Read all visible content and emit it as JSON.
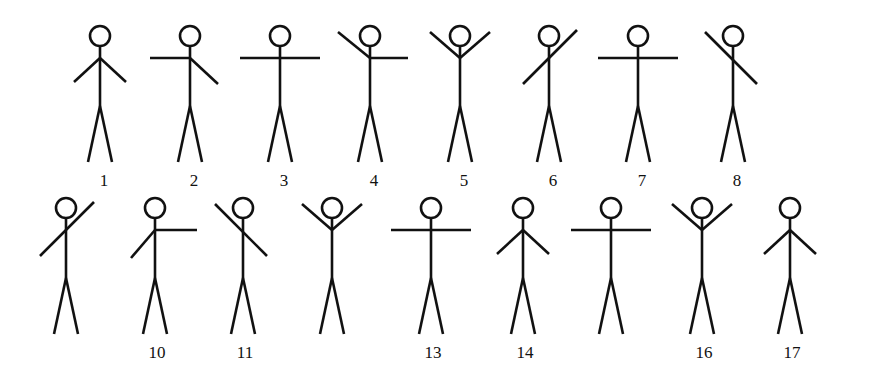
{
  "figures": [
    {
      "label": "1",
      "row": 0,
      "x": 100,
      "pose": "both-down"
    },
    {
      "label": "2",
      "row": 0,
      "x": 190,
      "pose": "left-horizontal-right-down"
    },
    {
      "label": "3",
      "row": 0,
      "x": 280,
      "pose": "both-horizontal"
    },
    {
      "label": "4",
      "row": 0,
      "x": 370,
      "pose": "left-up-right-horizontal"
    },
    {
      "label": "5",
      "row": 0,
      "x": 460,
      "pose": "both-up"
    },
    {
      "label": "6",
      "row": 0,
      "x": 549,
      "pose": "diagonal-lowleft-upright"
    },
    {
      "label": "7",
      "row": 0,
      "x": 638,
      "pose": "both-horizontal"
    },
    {
      "label": "8",
      "row": 0,
      "x": 733,
      "pose": "diagonal-upleft-lowright"
    },
    {
      "label": "",
      "row": 1,
      "x": 66,
      "pose": "diagonal-lowleft-upright"
    },
    {
      "label": "10",
      "row": 1,
      "x": 155,
      "pose": "left-down-right-horizontal"
    },
    {
      "label": "11",
      "row": 1,
      "x": 243,
      "pose": "diagonal-upleft-lowright"
    },
    {
      "label": "",
      "row": 1,
      "x": 332,
      "pose": "both-up"
    },
    {
      "label": "13",
      "row": 1,
      "x": 431,
      "pose": "both-horizontal"
    },
    {
      "label": "14",
      "row": 1,
      "x": 523,
      "pose": "both-down"
    },
    {
      "label": "",
      "row": 1,
      "x": 611,
      "pose": "both-horizontal"
    },
    {
      "label": "16",
      "row": 1,
      "x": 702,
      "pose": "both-up"
    },
    {
      "label": "17",
      "row": 1,
      "x": 790,
      "pose": "both-down"
    }
  ]
}
